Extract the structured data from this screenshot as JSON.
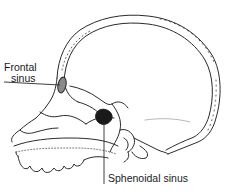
{
  "figure": {
    "labels": {
      "frontal_sinus_line1": "Frontal",
      "frontal_sinus_line2": "sinus",
      "sphenoidal_sinus": "Sphenoidal sinus"
    },
    "colors": {
      "line": "#2a2a2a",
      "frontal_sinus_fill": "#8a8a8a",
      "sphenoidal_sinus_fill": "#1a1a1a",
      "background": "#ffffff"
    }
  }
}
